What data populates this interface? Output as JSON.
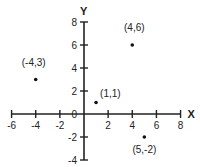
{
  "chart_data": {
    "type": "scatter",
    "title": "",
    "xlabel": "X",
    "ylabel": "Y",
    "xlim": [
      -6,
      8
    ],
    "ylim": [
      -4,
      8
    ],
    "grid": false,
    "legend": null,
    "x_ticks": [
      -6,
      -4,
      -2,
      0,
      2,
      4,
      6,
      8
    ],
    "x_tick_labels": [
      "-6",
      "-4",
      "-2",
      "0",
      "2",
      "4",
      "6",
      "8"
    ],
    "y_ticks": [
      -4,
      -2,
      0,
      2,
      4,
      6,
      8
    ],
    "y_tick_labels": [
      "-4",
      "-2",
      "0",
      "2",
      "4",
      "6",
      "8"
    ],
    "series": [
      {
        "name": "points",
        "points": [
          {
            "x": -4,
            "y": 3,
            "label": "(-4,3)"
          },
          {
            "x": 4,
            "y": 6,
            "label": "(4,6)"
          },
          {
            "x": 1,
            "y": 1,
            "label": "(1,1)"
          },
          {
            "x": 5,
            "y": -2,
            "label": "(5,-2)"
          }
        ]
      }
    ]
  },
  "colors": {
    "axis": "#222222",
    "point": "#111111",
    "background": "#ffffff"
  }
}
